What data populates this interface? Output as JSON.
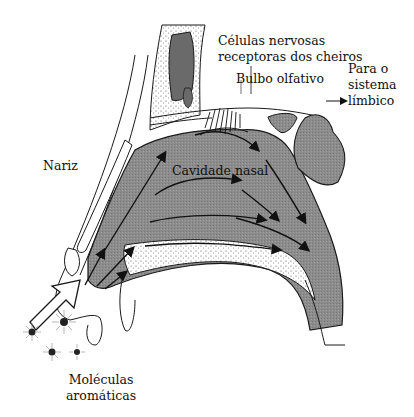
{
  "diagram": {
    "title": "",
    "colors": {
      "cavity_fill": "#8a8a8a",
      "dark_fill": "#6a6a6a",
      "outline": "#1a1a1a",
      "background": "#ffffff"
    },
    "labels": {
      "receptor_cells_line1": "Células nervosas",
      "receptor_cells_line2": "receptoras dos cheiros",
      "olfactory_bulb": "Bulbo olfativo",
      "limbic_line1": "Para o",
      "limbic_line2": "sistema",
      "limbic_line3": "límbico",
      "nose": "Nariz",
      "nasal_cavity": "Cavidade nasal",
      "molecules_line1": "Moléculas",
      "molecules_line2": "aromáticas"
    },
    "icons": {
      "inhale_arrow": "large-hollow-arrow",
      "airflow_arrows": "black-arrows",
      "molecules": "starburst-dots"
    }
  }
}
